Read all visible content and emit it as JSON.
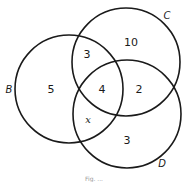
{
  "diagram": {
    "type": "venn",
    "sets": [
      {
        "name": "B",
        "label": "B"
      },
      {
        "name": "C",
        "label": "C"
      },
      {
        "name": "D",
        "label": "D"
      }
    ],
    "regions": {
      "B_only": "5",
      "C_only": "10",
      "D_only": "3",
      "B_and_C_only": "3",
      "C_and_D_only": "2",
      "B_and_D_only": "x",
      "B_and_C_and_D": "4"
    },
    "caption": "Fig. ..."
  }
}
